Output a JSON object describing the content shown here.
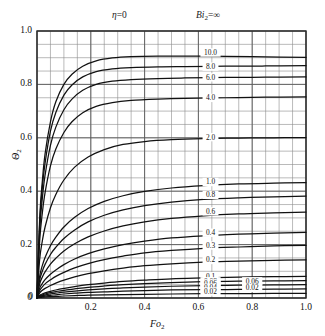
{
  "figure": {
    "annotations": {
      "eta_symbol": "η",
      "eta_value": "=0",
      "bi_symbol": "Bi",
      "bi_subscript": "2",
      "bi_value": "=∞"
    },
    "y_axis_label_symbol": "Θ",
    "y_axis_label_subscript": "2",
    "x_axis_label_symbol": "Fo",
    "x_axis_label_subscript": "2"
  },
  "chart_data": {
    "type": "line",
    "xlabel": "Fo₂",
    "ylabel": "Θ₂",
    "xlim": [
      0,
      1.0
    ],
    "ylim": [
      0,
      1.0
    ],
    "xticks": [
      "0",
      "0.2",
      "0.4",
      "0.6",
      "0.8",
      "1.0"
    ],
    "xtick_values": [
      0,
      0.2,
      0.4,
      0.6,
      0.8,
      1.0
    ],
    "yticks": [
      "0",
      "0.2",
      "0.4",
      "0.6",
      "0.8",
      "1.0"
    ],
    "ytick_values": [
      0,
      0.2,
      0.4,
      0.6,
      0.8,
      1.0
    ],
    "grid": true,
    "grid_minor_step_x": 0.05,
    "grid_minor_step_y": 0.05,
    "legend": "inline-curve-labels",
    "curve_label_x": 0.645,
    "series": [
      {
        "name": "10.0",
        "label": "10.0",
        "label_y": 0.915,
        "points": [
          [
            0,
            0
          ],
          [
            0.01,
            0.3
          ],
          [
            0.02,
            0.44
          ],
          [
            0.03,
            0.54
          ],
          [
            0.05,
            0.66
          ],
          [
            0.07,
            0.735
          ],
          [
            0.1,
            0.8
          ],
          [
            0.13,
            0.838
          ],
          [
            0.17,
            0.868
          ],
          [
            0.22,
            0.888
          ],
          [
            0.28,
            0.899
          ],
          [
            0.35,
            0.904
          ],
          [
            0.45,
            0.906
          ],
          [
            0.55,
            0.906
          ],
          [
            0.7,
            0.905
          ],
          [
            0.85,
            0.903
          ],
          [
            1.0,
            0.901
          ]
        ]
      },
      {
        "name": "8.0",
        "label": "8.0",
        "label_y": 0.862,
        "points": [
          [
            0,
            0
          ],
          [
            0.01,
            0.28
          ],
          [
            0.02,
            0.415
          ],
          [
            0.03,
            0.505
          ],
          [
            0.05,
            0.625
          ],
          [
            0.07,
            0.695
          ],
          [
            0.1,
            0.76
          ],
          [
            0.13,
            0.798
          ],
          [
            0.17,
            0.828
          ],
          [
            0.22,
            0.848
          ],
          [
            0.28,
            0.858
          ],
          [
            0.35,
            0.863
          ],
          [
            0.45,
            0.866
          ],
          [
            0.55,
            0.867
          ],
          [
            0.7,
            0.868
          ],
          [
            0.85,
            0.869
          ],
          [
            1.0,
            0.87
          ]
        ]
      },
      {
        "name": "6.0",
        "label": "6.0",
        "label_y": 0.822,
        "points": [
          [
            0,
            0
          ],
          [
            0.01,
            0.255
          ],
          [
            0.02,
            0.375
          ],
          [
            0.03,
            0.46
          ],
          [
            0.05,
            0.572
          ],
          [
            0.07,
            0.64
          ],
          [
            0.1,
            0.705
          ],
          [
            0.13,
            0.745
          ],
          [
            0.17,
            0.778
          ],
          [
            0.22,
            0.8
          ],
          [
            0.28,
            0.812
          ],
          [
            0.35,
            0.818
          ],
          [
            0.45,
            0.822
          ],
          [
            0.55,
            0.824
          ],
          [
            0.7,
            0.826
          ],
          [
            0.85,
            0.827
          ],
          [
            1.0,
            0.828
          ]
        ]
      },
      {
        "name": "4.0",
        "label": "4.0",
        "label_y": 0.745,
        "points": [
          [
            0,
            0
          ],
          [
            0.01,
            0.215
          ],
          [
            0.02,
            0.32
          ],
          [
            0.03,
            0.395
          ],
          [
            0.05,
            0.495
          ],
          [
            0.07,
            0.558
          ],
          [
            0.1,
            0.62
          ],
          [
            0.13,
            0.66
          ],
          [
            0.17,
            0.694
          ],
          [
            0.22,
            0.718
          ],
          [
            0.28,
            0.732
          ],
          [
            0.35,
            0.74
          ],
          [
            0.45,
            0.745
          ],
          [
            0.55,
            0.748
          ],
          [
            0.7,
            0.75
          ],
          [
            0.85,
            0.752
          ],
          [
            1.0,
            0.753
          ]
        ]
      },
      {
        "name": "2.0",
        "label": "2.0",
        "label_y": 0.598,
        "points": [
          [
            0,
            0
          ],
          [
            0.01,
            0.145
          ],
          [
            0.02,
            0.215
          ],
          [
            0.03,
            0.266
          ],
          [
            0.05,
            0.338
          ],
          [
            0.07,
            0.388
          ],
          [
            0.1,
            0.442
          ],
          [
            0.14,
            0.49
          ],
          [
            0.19,
            0.528
          ],
          [
            0.25,
            0.556
          ],
          [
            0.32,
            0.575
          ],
          [
            0.4,
            0.586
          ],
          [
            0.5,
            0.593
          ],
          [
            0.62,
            0.597
          ],
          [
            0.75,
            0.599
          ],
          [
            0.88,
            0.6
          ],
          [
            1.0,
            0.601
          ]
        ]
      },
      {
        "name": "1.0",
        "label": "1.0",
        "label_y": 0.43,
        "points": [
          [
            0,
            0
          ],
          [
            0.01,
            0.082
          ],
          [
            0.02,
            0.122
          ],
          [
            0.03,
            0.152
          ],
          [
            0.05,
            0.196
          ],
          [
            0.07,
            0.228
          ],
          [
            0.1,
            0.266
          ],
          [
            0.14,
            0.302
          ],
          [
            0.19,
            0.335
          ],
          [
            0.25,
            0.362
          ],
          [
            0.32,
            0.383
          ],
          [
            0.4,
            0.399
          ],
          [
            0.5,
            0.412
          ],
          [
            0.62,
            0.421
          ],
          [
            0.75,
            0.427
          ],
          [
            0.88,
            0.43
          ],
          [
            1.0,
            0.432
          ]
        ]
      },
      {
        "name": "0.8",
        "label": "0.8",
        "label_y": 0.382,
        "points": [
          [
            0,
            0
          ],
          [
            0.01,
            0.068
          ],
          [
            0.02,
            0.101
          ],
          [
            0.03,
            0.126
          ],
          [
            0.05,
            0.163
          ],
          [
            0.07,
            0.19
          ],
          [
            0.1,
            0.223
          ],
          [
            0.14,
            0.255
          ],
          [
            0.19,
            0.285
          ],
          [
            0.25,
            0.31
          ],
          [
            0.32,
            0.33
          ],
          [
            0.4,
            0.346
          ],
          [
            0.5,
            0.359
          ],
          [
            0.62,
            0.369
          ],
          [
            0.75,
            0.375
          ],
          [
            0.88,
            0.379
          ],
          [
            1.0,
            0.382
          ]
        ]
      },
      {
        "name": "0.6",
        "label": "0.6",
        "label_y": 0.32,
        "points": [
          [
            0,
            0
          ],
          [
            0.01,
            0.053
          ],
          [
            0.02,
            0.079
          ],
          [
            0.03,
            0.098
          ],
          [
            0.05,
            0.127
          ],
          [
            0.07,
            0.149
          ],
          [
            0.1,
            0.176
          ],
          [
            0.14,
            0.203
          ],
          [
            0.19,
            0.229
          ],
          [
            0.25,
            0.251
          ],
          [
            0.32,
            0.27
          ],
          [
            0.4,
            0.285
          ],
          [
            0.5,
            0.298
          ],
          [
            0.62,
            0.308
          ],
          [
            0.75,
            0.315
          ],
          [
            0.88,
            0.319
          ],
          [
            1.0,
            0.322
          ]
        ]
      },
      {
        "name": "0.4",
        "label": "0.4",
        "label_y": 0.24,
        "points": [
          [
            0,
            0
          ],
          [
            0.01,
            0.037
          ],
          [
            0.02,
            0.055
          ],
          [
            0.03,
            0.069
          ],
          [
            0.05,
            0.089
          ],
          [
            0.07,
            0.105
          ],
          [
            0.1,
            0.125
          ],
          [
            0.14,
            0.146
          ],
          [
            0.19,
            0.166
          ],
          [
            0.25,
            0.184
          ],
          [
            0.32,
            0.2
          ],
          [
            0.4,
            0.213
          ],
          [
            0.5,
            0.225
          ],
          [
            0.62,
            0.233
          ],
          [
            0.75,
            0.239
          ],
          [
            0.88,
            0.243
          ],
          [
            1.0,
            0.246
          ]
        ]
      },
      {
        "name": "0.3",
        "label": "0.3",
        "label_y": 0.192,
        "points": [
          [
            0,
            0
          ],
          [
            0.01,
            0.028
          ],
          [
            0.02,
            0.042
          ],
          [
            0.03,
            0.053
          ],
          [
            0.05,
            0.068
          ],
          [
            0.07,
            0.081
          ],
          [
            0.1,
            0.096
          ],
          [
            0.14,
            0.113
          ],
          [
            0.19,
            0.129
          ],
          [
            0.25,
            0.144
          ],
          [
            0.32,
            0.157
          ],
          [
            0.4,
            0.169
          ],
          [
            0.5,
            0.178
          ],
          [
            0.62,
            0.186
          ],
          [
            0.75,
            0.191
          ],
          [
            0.88,
            0.195
          ],
          [
            1.0,
            0.197
          ]
        ]
      },
      {
        "name": "0.2",
        "label": "0.2",
        "label_y": 0.138,
        "points": [
          [
            0,
            0
          ],
          [
            0.01,
            0.019
          ],
          [
            0.02,
            0.029
          ],
          [
            0.03,
            0.036
          ],
          [
            0.05,
            0.047
          ],
          [
            0.07,
            0.056
          ],
          [
            0.1,
            0.067
          ],
          [
            0.14,
            0.079
          ],
          [
            0.19,
            0.091
          ],
          [
            0.25,
            0.102
          ],
          [
            0.32,
            0.112
          ],
          [
            0.4,
            0.121
          ],
          [
            0.5,
            0.128
          ],
          [
            0.62,
            0.134
          ],
          [
            0.75,
            0.138
          ],
          [
            0.88,
            0.141
          ],
          [
            1.0,
            0.143
          ]
        ]
      },
      {
        "name": "0.1",
        "label": "0.1",
        "label_y": 0.077,
        "points": [
          [
            0,
            0
          ],
          [
            0.01,
            0.01
          ],
          [
            0.02,
            0.015
          ],
          [
            0.03,
            0.019
          ],
          [
            0.05,
            0.025
          ],
          [
            0.07,
            0.03
          ],
          [
            0.1,
            0.036
          ],
          [
            0.14,
            0.043
          ],
          [
            0.19,
            0.05
          ],
          [
            0.25,
            0.056
          ],
          [
            0.32,
            0.062
          ],
          [
            0.4,
            0.067
          ],
          [
            0.5,
            0.072
          ],
          [
            0.62,
            0.075
          ],
          [
            0.75,
            0.078
          ],
          [
            0.88,
            0.08
          ],
          [
            1.0,
            0.081
          ]
        ]
      },
      {
        "name": "0.08",
        "label": "0.08",
        "label_y": 0.058,
        "points": [
          [
            0,
            0
          ],
          [
            0.01,
            0.008
          ],
          [
            0.02,
            0.012
          ],
          [
            0.03,
            0.015
          ],
          [
            0.05,
            0.02
          ],
          [
            0.07,
            0.024
          ],
          [
            0.1,
            0.029
          ],
          [
            0.14,
            0.034
          ],
          [
            0.19,
            0.04
          ],
          [
            0.25,
            0.045
          ],
          [
            0.32,
            0.05
          ],
          [
            0.4,
            0.054
          ],
          [
            0.5,
            0.058
          ],
          [
            0.62,
            0.061
          ],
          [
            0.75,
            0.063
          ],
          [
            0.88,
            0.064
          ],
          [
            1.0,
            0.065
          ]
        ]
      },
      {
        "name": "0.06",
        "label": "0.06",
        "label_y": 0.05,
        "points": [
          [
            0,
            0
          ],
          [
            0.01,
            0.006
          ],
          [
            0.02,
            0.009
          ],
          [
            0.03,
            0.011
          ],
          [
            0.05,
            0.015
          ],
          [
            0.07,
            0.018
          ],
          [
            0.1,
            0.022
          ],
          [
            0.14,
            0.026
          ],
          [
            0.19,
            0.03
          ],
          [
            0.25,
            0.034
          ],
          [
            0.32,
            0.038
          ],
          [
            0.4,
            0.041
          ],
          [
            0.5,
            0.044
          ],
          [
            0.62,
            0.046
          ],
          [
            0.75,
            0.048
          ],
          [
            0.88,
            0.049
          ],
          [
            1.0,
            0.05
          ]
        ]
      },
      {
        "name": "0.04",
        "label": "0.04",
        "label_y": 0.034,
        "points": [
          [
            0,
            0
          ],
          [
            0.01,
            0.004
          ],
          [
            0.02,
            0.006
          ],
          [
            0.03,
            0.0075
          ],
          [
            0.05,
            0.01
          ],
          [
            0.07,
            0.012
          ],
          [
            0.1,
            0.015
          ],
          [
            0.14,
            0.018
          ],
          [
            0.19,
            0.021
          ],
          [
            0.25,
            0.023
          ],
          [
            0.32,
            0.026
          ],
          [
            0.4,
            0.028
          ],
          [
            0.5,
            0.03
          ],
          [
            0.62,
            0.031
          ],
          [
            0.75,
            0.032
          ],
          [
            0.88,
            0.033
          ],
          [
            1.0,
            0.034
          ]
        ]
      },
      {
        "name": "0.02",
        "label": "0.02",
        "label_y": 0.02,
        "points": [
          [
            0,
            0
          ],
          [
            0.01,
            0.002
          ],
          [
            0.02,
            0.003
          ],
          [
            0.03,
            0.004
          ],
          [
            0.05,
            0.005
          ],
          [
            0.07,
            0.006
          ],
          [
            0.1,
            0.0075
          ],
          [
            0.14,
            0.009
          ],
          [
            0.19,
            0.011
          ],
          [
            0.25,
            0.012
          ],
          [
            0.32,
            0.013
          ],
          [
            0.4,
            0.014
          ],
          [
            0.5,
            0.015
          ],
          [
            0.62,
            0.016
          ],
          [
            0.75,
            0.0165
          ],
          [
            0.88,
            0.017
          ],
          [
            1.0,
            0.017
          ]
        ]
      }
    ],
    "extra_labels": [
      {
        "text": "0.06",
        "x": 0.8,
        "y": 0.058
      },
      {
        "text": "0.02",
        "x": 0.8,
        "y": 0.033
      }
    ]
  }
}
